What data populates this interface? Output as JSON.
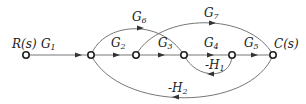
{
  "diagram": {
    "type": "signal-flow-graph",
    "nodes": [
      {
        "id": "R",
        "label": "R(s)",
        "x": 26,
        "y": 55
      },
      {
        "id": "n2",
        "label": "",
        "x": 91,
        "y": 55
      },
      {
        "id": "n3",
        "label": "",
        "x": 136,
        "y": 55
      },
      {
        "id": "n4",
        "label": "",
        "x": 184,
        "y": 55
      },
      {
        "id": "n5",
        "label": "",
        "x": 232,
        "y": 55
      },
      {
        "id": "C",
        "label": "C(s)",
        "x": 273,
        "y": 55
      }
    ],
    "edges": [
      {
        "from": "R",
        "to": "n2",
        "gain": "G1",
        "gain_base": "G",
        "gain_sub": "1"
      },
      {
        "from": "n2",
        "to": "n3",
        "gain": "G2",
        "gain_base": "G",
        "gain_sub": "2"
      },
      {
        "from": "n3",
        "to": "n4",
        "gain": "G3",
        "gain_base": "G",
        "gain_sub": "3"
      },
      {
        "from": "n4",
        "to": "n5",
        "gain": "G4",
        "gain_base": "G",
        "gain_sub": "4"
      },
      {
        "from": "n5",
        "to": "C",
        "gain": "G5",
        "gain_base": "G",
        "gain_sub": "5"
      },
      {
        "from": "n2",
        "to": "n4",
        "gain": "G6",
        "gain_base": "G",
        "gain_sub": "6"
      },
      {
        "from": "n3",
        "to": "C",
        "gain": "G7",
        "gain_base": "G",
        "gain_sub": "7"
      },
      {
        "from": "n5",
        "to": "n4",
        "gain": "-H1",
        "gain_base": "-H",
        "gain_sub": "1"
      },
      {
        "from": "C",
        "to": "n2",
        "gain": "-H2",
        "gain_base": "-H",
        "gain_sub": "2"
      }
    ],
    "labels": {
      "input": "R(s)",
      "output": "C(s)"
    }
  }
}
